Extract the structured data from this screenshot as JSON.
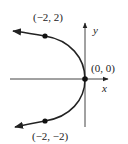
{
  "figure": {
    "type": "parabola-sketch",
    "equation_shape": "parabola opening left, vertex at origin",
    "axes": {
      "x_label": "x",
      "y_label": "y"
    },
    "points": [
      {
        "label": "(−2, 2)",
        "x": -2,
        "y": 2
      },
      {
        "label": "(0, 0)",
        "x": 0,
        "y": 0
      },
      {
        "label": "(−2, −2)",
        "x": -2,
        "y": -2
      }
    ],
    "colors": {
      "stroke": "#222222",
      "background": "#ffffff"
    }
  }
}
